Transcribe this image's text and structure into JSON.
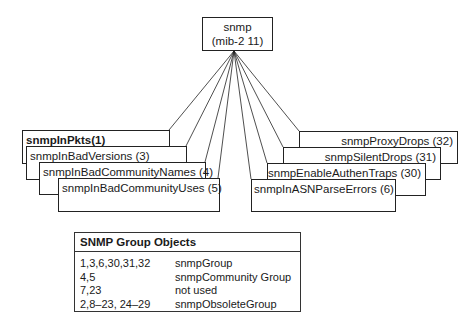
{
  "root": {
    "line1": "snmp",
    "line2": "(mib-2 11)"
  },
  "left_boxes": [
    {
      "label": "snmpInPkts(1)",
      "bold": true
    },
    {
      "label": "snmpInBadVersions (3)"
    },
    {
      "label": "snmpInBadCommunityNames (4)"
    },
    {
      "label": "snmpInBadCommunityUses (5)"
    }
  ],
  "right_boxes": [
    {
      "label": "snmpProxyDrops (32)"
    },
    {
      "label": "snmpSilentDrops (31)"
    },
    {
      "label": "snmpEnableAuthenTraps (30)"
    },
    {
      "label": "snmpInASNParseErrors (6)"
    }
  ],
  "legend": {
    "title": "SNMP Group Objects",
    "rows": [
      {
        "ids": "1,3,6,30,31,32",
        "group": "snmpGroup"
      },
      {
        "ids": "4,5",
        "group": "snmpCommunity Group"
      },
      {
        "ids": "7,23",
        "group": "not used"
      },
      {
        "ids": "2,8–23, 24–29",
        "group": "snmpObsoleteGroup"
      }
    ]
  }
}
